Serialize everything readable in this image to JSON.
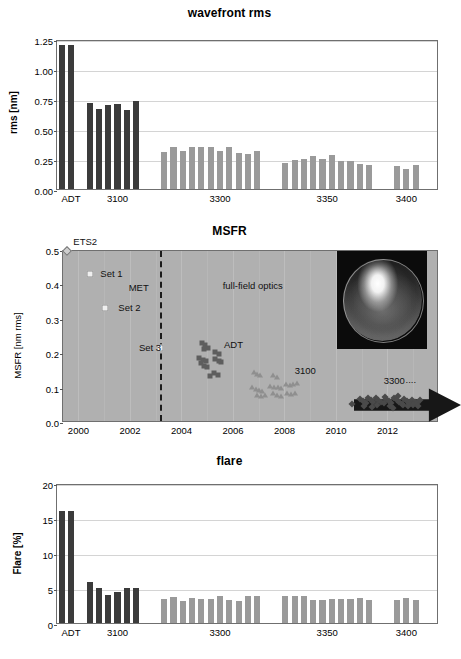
{
  "figure": {
    "panels": [
      "wavefront rms",
      "MSFR",
      "flare"
    ]
  },
  "chart_data": [
    {
      "id": "wavefront",
      "type": "bar",
      "title": "wavefront rms",
      "xlabel": "",
      "ylabel": "rms [nm]",
      "ylim": [
        0,
        1.25
      ],
      "yticks": [
        "0.00",
        "0.25",
        "0.50",
        "0.75",
        "1.00",
        "1.25"
      ],
      "ytick_values": [
        0,
        0.25,
        0.5,
        0.75,
        1.0,
        1.25
      ],
      "xtick_labels": [
        "ADT",
        "3100",
        "3300",
        "3350",
        "3400"
      ],
      "xtick_positions": [
        1.0,
        6.0,
        17.0,
        28.5,
        37.0
      ],
      "grid": "horizontal",
      "groups": [
        {
          "name": "ADT",
          "color": "#3b3b3b",
          "start_index": 0,
          "values": [
            1.2,
            1.2
          ]
        },
        {
          "name": "3100",
          "color": "#3b3b3b",
          "start_index": 3,
          "values": [
            0.72,
            0.67,
            0.7,
            0.71,
            0.66,
            0.73
          ]
        },
        {
          "name": "3300",
          "color": "#9a9a9a",
          "start_index": 11,
          "values": [
            0.31,
            0.35,
            0.32,
            0.35,
            0.35,
            0.35,
            0.32,
            0.35,
            0.3,
            0.29,
            0.32
          ]
        },
        {
          "name": "3350",
          "color": "#9a9a9a",
          "start_index": 24,
          "values": [
            0.22,
            0.245,
            0.25,
            0.275,
            0.25,
            0.285,
            0.23,
            0.235,
            0.205,
            0.2
          ]
        },
        {
          "name": "3400",
          "color": "#9a9a9a",
          "start_index": 36,
          "values": [
            0.19,
            0.165,
            0.2
          ]
        }
      ]
    },
    {
      "id": "msfr",
      "type": "scatter",
      "title": "MSFR",
      "xlabel": "",
      "ylabel": "MSFR [nm rms]",
      "ylim": [
        0.0,
        0.5
      ],
      "xlim": [
        1999.4,
        2014.0
      ],
      "yticks": [
        "0.0",
        "0.1",
        "0.2",
        "0.3",
        "0.4",
        "0.5"
      ],
      "ytick_values": [
        0.0,
        0.1,
        0.2,
        0.3,
        0.4,
        0.5
      ],
      "xticks": [
        "2000",
        "2002",
        "2004",
        "2006",
        "2008",
        "2010",
        "2012"
      ],
      "xtick_values": [
        2000,
        2002,
        2004,
        2006,
        2008,
        2010,
        2012
      ],
      "grid": "vertical",
      "plot_background": "#b0b0b0",
      "annotations": [
        {
          "text": "ETS2",
          "x": 1999.8,
          "y": 0.525,
          "name": "ets2-label"
        },
        {
          "text": "Set 1",
          "x": 2000.85,
          "y": 0.432,
          "name": "set1-label"
        },
        {
          "text": "Set 2",
          "x": 2001.55,
          "y": 0.333,
          "name": "set2-label"
        },
        {
          "text": "Set 3",
          "x": 2002.35,
          "y": 0.218,
          "name": "set3-label"
        },
        {
          "text": "MET",
          "x": 2001.95,
          "y": 0.392,
          "name": "met-label"
        },
        {
          "text": "full-field  optics",
          "x": 2005.6,
          "y": 0.398,
          "name": "full-field-optics-label"
        },
        {
          "text": "ADT",
          "x": 2005.65,
          "y": 0.228,
          "name": "adt-label"
        },
        {
          "text": "3100",
          "x": 2008.4,
          "y": 0.152,
          "name": "group-3100-label"
        },
        {
          "text": "3300",
          "x": 2011.85,
          "y": 0.123,
          "name": "group-3300-label"
        },
        {
          "text": "....",
          "x": 2012.7,
          "y": 0.125,
          "name": "ellipsis-label"
        }
      ],
      "vertical_dashed_line_x": 2003.15,
      "series": [
        {
          "name": "ETS2",
          "marker": "diamond-light",
          "points": [
            [
              1999.55,
              0.5
            ]
          ]
        },
        {
          "name": "MET sets",
          "marker": "square-light",
          "points": [
            [
              2000.45,
              0.432
            ],
            [
              2001.05,
              0.333
            ],
            [
              2003.15,
              0.218
            ]
          ]
        },
        {
          "name": "ADT",
          "marker": "square-dark",
          "points": [
            [
              2004.78,
              0.232
            ],
            [
              2004.92,
              0.226
            ],
            [
              2005.02,
              0.219
            ],
            [
              2004.86,
              0.214
            ],
            [
              2005.32,
              0.206
            ],
            [
              2005.45,
              0.2
            ],
            [
              2004.7,
              0.188
            ],
            [
              2004.82,
              0.183
            ],
            [
              2004.95,
              0.18
            ],
            [
              2004.74,
              0.174
            ],
            [
              2005.3,
              0.186
            ],
            [
              2005.44,
              0.181
            ],
            [
              2005.55,
              0.178
            ],
            [
              2004.86,
              0.166
            ],
            [
              2005.0,
              0.162
            ],
            [
              2005.28,
              0.146
            ],
            [
              2005.4,
              0.14
            ],
            [
              2005.1,
              0.136
            ]
          ]
        },
        {
          "name": "3100",
          "marker": "triangle",
          "points": [
            [
              2006.8,
              0.148
            ],
            [
              2006.92,
              0.142
            ],
            [
              2007.05,
              0.139
            ],
            [
              2007.55,
              0.14
            ],
            [
              2007.7,
              0.135
            ],
            [
              2006.75,
              0.104
            ],
            [
              2006.88,
              0.1
            ],
            [
              2007.0,
              0.097
            ],
            [
              2007.12,
              0.094
            ],
            [
              2007.45,
              0.109
            ],
            [
              2007.6,
              0.106
            ],
            [
              2007.75,
              0.104
            ],
            [
              2007.88,
              0.101
            ],
            [
              2008.05,
              0.113
            ],
            [
              2008.2,
              0.11
            ],
            [
              2008.35,
              0.112
            ],
            [
              2008.5,
              0.115
            ],
            [
              2006.95,
              0.082
            ],
            [
              2007.1,
              0.079
            ],
            [
              2007.25,
              0.082
            ],
            [
              2007.55,
              0.086
            ],
            [
              2007.7,
              0.082
            ],
            [
              2007.85,
              0.078
            ],
            [
              2008.1,
              0.088
            ],
            [
              2008.25,
              0.084
            ],
            [
              2008.4,
              0.086
            ]
          ]
        },
        {
          "name": "3300 ....",
          "marker": "diamond-dark",
          "points": [
            [
              2010.62,
              0.055
            ],
            [
              2010.95,
              0.07
            ],
            [
              2011.05,
              0.064
            ],
            [
              2011.15,
              0.058
            ],
            [
              2011.25,
              0.072
            ],
            [
              2011.35,
              0.066
            ],
            [
              2011.45,
              0.06
            ],
            [
              2011.55,
              0.074
            ],
            [
              2011.65,
              0.068
            ],
            [
              2011.75,
              0.062
            ],
            [
              2011.85,
              0.057
            ],
            [
              2011.95,
              0.071
            ],
            [
              2012.05,
              0.065
            ],
            [
              2012.15,
              0.059
            ],
            [
              2012.25,
              0.073
            ],
            [
              2012.35,
              0.067
            ],
            [
              2012.45,
              0.061
            ],
            [
              2012.55,
              0.056
            ],
            [
              2012.65,
              0.07
            ],
            [
              2012.75,
              0.064
            ],
            [
              2012.85,
              0.058
            ],
            [
              2012.95,
              0.068
            ],
            [
              2013.05,
              0.062
            ],
            [
              2013.15,
              0.057
            ],
            [
              2013.25,
              0.066
            ],
            [
              2011.1,
              0.049
            ],
            [
              2011.6,
              0.051
            ],
            [
              2012.1,
              0.05
            ],
            [
              2012.6,
              0.052
            ],
            [
              2013.0,
              0.053
            ],
            [
              2011.9,
              0.077
            ],
            [
              2012.4,
              0.079
            ],
            [
              2012.2,
              0.045
            ],
            [
              2011.4,
              0.046
            ],
            [
              2012.8,
              0.048
            ],
            [
              2013.2,
              0.05
            ]
          ]
        }
      ],
      "inset": {
        "name": "optic-photo",
        "caption": ""
      },
      "arrow": {
        "name": "trend-arrow",
        "direction": "right"
      }
    },
    {
      "id": "flare",
      "type": "bar",
      "title": "flare",
      "xlabel": "",
      "ylabel": "Flare [%]",
      "ylim": [
        0,
        20
      ],
      "yticks": [
        "0",
        "5",
        "10",
        "15",
        "20"
      ],
      "ytick_values": [
        0,
        5,
        10,
        15,
        20
      ],
      "xtick_labels": [
        "ADT",
        "3100",
        "3300",
        "3350",
        "3400"
      ],
      "xtick_positions": [
        1.0,
        6.0,
        17.0,
        28.5,
        37.0
      ],
      "grid": "horizontal",
      "groups": [
        {
          "name": "ADT",
          "color": "#3b3b3b",
          "start_index": 0,
          "values": [
            16.0,
            16.0
          ]
        },
        {
          "name": "3100",
          "color": "#3b3b3b",
          "start_index": 3,
          "values": [
            5.9,
            5.0,
            4.0,
            4.5,
            5.0,
            5.0
          ]
        },
        {
          "name": "3300",
          "color": "#9a9a9a",
          "start_index": 11,
          "values": [
            3.5,
            3.7,
            3.2,
            3.6,
            3.4,
            3.5,
            3.9,
            3.3,
            3.1,
            3.9,
            3.8
          ]
        },
        {
          "name": "3350",
          "color": "#9a9a9a",
          "start_index": 24,
          "values": [
            3.85,
            3.8,
            3.85,
            3.25,
            3.35,
            3.4,
            3.4,
            3.4,
            3.6,
            3.3
          ]
        },
        {
          "name": "3400",
          "color": "#9a9a9a",
          "start_index": 36,
          "values": [
            3.3,
            3.55,
            3.3
          ]
        }
      ]
    }
  ]
}
